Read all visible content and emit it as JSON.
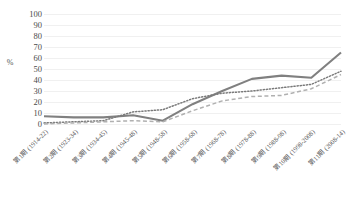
{
  "chart_data": {
    "type": "line",
    "title": "",
    "subtitle": "",
    "xlabel": "",
    "ylabel": "%",
    "ylim": [
      0,
      100
    ],
    "y_ticks": [
      0,
      10,
      20,
      30,
      40,
      50,
      60,
      70,
      80,
      90,
      100
    ],
    "grid": true,
    "legend": "none",
    "categories": [
      "第1期 (1914-22)",
      "第2期 (1923-34)",
      "第3期 (1934-45)",
      "第4期 (1945-48)",
      "第5期 (1948-58)",
      "第6期 (1958-68)",
      "第7期 (1968-78)",
      "第8期 (1978-88)",
      "第9期 (1988-98)",
      "第10期 (1998-2008)",
      "第11期 (2008-14)"
    ],
    "series": [
      {
        "name": "series-solid",
        "style": "solid",
        "color": "#808080",
        "values": [
          7,
          6,
          6,
          8,
          3,
          18,
          30,
          41,
          44,
          42,
          65
        ]
      },
      {
        "name": "series-dotted",
        "style": "dotted",
        "color": "#7a7a7a",
        "values": [
          1,
          2,
          3,
          11,
          13,
          23,
          28,
          30,
          33,
          36,
          48
        ]
      },
      {
        "name": "series-dashed",
        "style": "dashed",
        "color": "#b0b0b0",
        "values": [
          0,
          1,
          2,
          3,
          2,
          12,
          21,
          25,
          26,
          32,
          45
        ]
      }
    ]
  },
  "axis": {
    "y_title": "%",
    "y_tick_labels": [
      "100",
      "90",
      "80",
      "70",
      "60",
      "50",
      "40",
      "30",
      "20",
      "10",
      "0"
    ]
  },
  "colors": {
    "gridline": "#f0f0f0",
    "background": "#ffffff",
    "solid_series": "#808080",
    "dotted_series": "#7a7a7a",
    "dashed_series": "#b0b0b0",
    "text": "#4a4a4a"
  }
}
